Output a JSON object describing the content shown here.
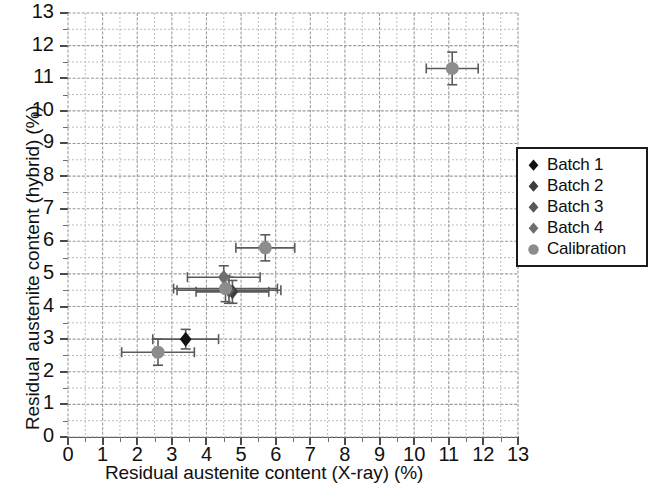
{
  "chart_data": {
    "type": "scatter",
    "title": "",
    "xlabel": "Residual austenite content (X-ray) (%)",
    "ylabel": "Residual austenite content (hybrid) (%)",
    "xlim": [
      0,
      13
    ],
    "ylim": [
      0,
      13
    ],
    "xticks": [
      0,
      1,
      2,
      3,
      4,
      5,
      6,
      7,
      8,
      9,
      10,
      11,
      12,
      13
    ],
    "yticks": [
      0,
      1,
      2,
      3,
      4,
      5,
      6,
      7,
      8,
      9,
      10,
      11,
      12,
      13
    ],
    "xtick_labels": [
      "0",
      "1",
      "2",
      "3",
      "4",
      "5",
      "6",
      "7",
      "8",
      "9",
      "10",
      "11",
      "12",
      "13"
    ],
    "ytick_labels": [
      "0",
      "1",
      "2",
      "3",
      "4",
      "5",
      "6",
      "7",
      "8",
      "9",
      "10",
      "11",
      "12",
      "13"
    ],
    "grid": true,
    "grid_major_step": 1,
    "grid_minor_step": 0.5,
    "legend_position": "right",
    "error_bars": "x and y",
    "series": [
      {
        "name": "Batch 1",
        "marker": "diamond",
        "color": "#111111",
        "points": [
          {
            "x": 3.4,
            "y": 3.0,
            "xerr": 0.95,
            "yerr": 0.3
          }
        ]
      },
      {
        "name": "Batch 2",
        "marker": "diamond",
        "color": "#3d3d3d",
        "points": [
          {
            "x": 4.75,
            "y": 4.45,
            "xerr": 1.05,
            "yerr": 0.35
          }
        ]
      },
      {
        "name": "Batch 3",
        "marker": "diamond",
        "color": "#585858",
        "points": [
          {
            "x": 4.65,
            "y": 4.5,
            "xerr": 1.5,
            "yerr": 0.4
          }
        ]
      },
      {
        "name": "Batch 4",
        "marker": "diamond",
        "color": "#6e6e6e",
        "points": [
          {
            "x": 4.5,
            "y": 4.9,
            "xerr": 1.05,
            "yerr": 0.35
          }
        ]
      },
      {
        "name": "Calibration",
        "marker": "circle",
        "color": "#8c8c8c",
        "points": [
          {
            "x": 2.6,
            "y": 2.6,
            "xerr": 1.05,
            "yerr": 0.4
          },
          {
            "x": 4.55,
            "y": 4.55,
            "xerr": 1.5,
            "yerr": 0.4
          },
          {
            "x": 5.7,
            "y": 5.8,
            "xerr": 0.85,
            "yerr": 0.4
          },
          {
            "x": 11.1,
            "y": 11.3,
            "xerr": 0.75,
            "yerr": 0.5
          }
        ]
      }
    ]
  },
  "legend": {
    "entries": [
      {
        "label": "Batch 1",
        "marker": "diamond",
        "color": "#111111"
      },
      {
        "label": "Batch 2",
        "marker": "diamond",
        "color": "#3d3d3d"
      },
      {
        "label": "Batch 3",
        "marker": "diamond",
        "color": "#585858"
      },
      {
        "label": "Batch 4",
        "marker": "diamond",
        "color": "#6e6e6e"
      },
      {
        "label": "Calibration",
        "marker": "circle",
        "color": "#8c8c8c"
      }
    ]
  },
  "colors": {
    "axis": "#4a4a4a",
    "grid_major": "#9b9b9b",
    "grid_minor": "#bdbdbd",
    "error_bar": "#5a5a5a",
    "text": "#111111",
    "background": "#ffffff"
  }
}
